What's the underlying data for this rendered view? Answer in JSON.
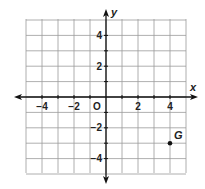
{
  "chart_data": {
    "type": "scatter",
    "title": "",
    "xlabel": "x",
    "ylabel": "y",
    "xlim": [
      -5,
      5
    ],
    "ylim": [
      -5,
      5
    ],
    "grid": true,
    "grid_step": 1,
    "x_tick_labels": [
      {
        "value": -4,
        "label": "−4"
      },
      {
        "value": -2,
        "label": "−2"
      },
      {
        "value": 2,
        "label": "2"
      },
      {
        "value": 4,
        "label": "4"
      }
    ],
    "y_tick_labels": [
      {
        "value": 4,
        "label": "4"
      },
      {
        "value": 2,
        "label": "2"
      },
      {
        "value": -2,
        "label": "−2"
      },
      {
        "value": -4,
        "label": "−4"
      }
    ],
    "origin_label": "O",
    "points": [
      {
        "name": "G",
        "x": 4,
        "y": -3
      }
    ],
    "colors": {
      "grid": "#9a9a9a",
      "axis": "#111111",
      "point": "#111111",
      "text": "#222222"
    }
  }
}
